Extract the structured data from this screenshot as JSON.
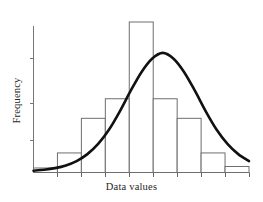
{
  "chart_data": {
    "type": "bar",
    "title": "",
    "subtitle": "",
    "xlabel": "Data values",
    "ylabel": "Frequency",
    "legend": [],
    "grid": false,
    "axis": {
      "x_tick_count": 10,
      "y_tick_count": 3,
      "x_tick_labels": [
        "",
        "",
        "",
        "",
        "",
        "",
        "",
        "",
        "",
        ""
      ],
      "y_tick_labels": [
        "",
        "",
        ""
      ],
      "xlim": [
        0,
        9
      ],
      "ylim": [
        0,
        100
      ]
    },
    "categories": [
      "1",
      "2",
      "3",
      "4",
      "5",
      "6",
      "7",
      "8",
      "9"
    ],
    "values": [
      3,
      13,
      36,
      49,
      100,
      49,
      36,
      13,
      4
    ],
    "bar_edge_color": "#6e6e6e",
    "bar_fill_color": "#ffffff",
    "overlay": {
      "type": "line",
      "name": "normal-curve",
      "color": "#111111",
      "x": [
        0.0,
        0.45,
        0.9,
        1.35,
        1.8,
        2.25,
        2.7,
        3.15,
        3.6,
        4.05,
        4.5,
        4.95,
        5.4,
        5.85,
        6.3,
        6.75,
        7.2,
        7.65,
        8.1,
        8.55,
        9.0
      ],
      "y": [
        1.2,
        1.8,
        2.9,
        4.7,
        7.6,
        12.2,
        19.0,
        28.4,
        40.5,
        54.0,
        66.5,
        75.6,
        79.5,
        75.6,
        66.5,
        54.0,
        40.5,
        28.4,
        19.0,
        12.2,
        7.6
      ]
    }
  }
}
